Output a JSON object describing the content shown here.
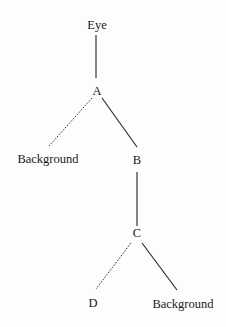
{
  "diagram": {
    "type": "tree",
    "nodes": [
      {
        "id": "eye",
        "label": "Eye",
        "x": 97,
        "y": 28
      },
      {
        "id": "A",
        "label": "A",
        "x": 97,
        "y": 94
      },
      {
        "id": "bg1",
        "label": "Background",
        "x": 48,
        "y": 162
      },
      {
        "id": "B",
        "label": "B",
        "x": 137,
        "y": 163
      },
      {
        "id": "C",
        "label": "C",
        "x": 137,
        "y": 239
      },
      {
        "id": "D",
        "label": "D",
        "x": 93,
        "y": 306
      },
      {
        "id": "bg2",
        "label": "Background",
        "x": 183,
        "y": 307
      }
    ],
    "edges": [
      {
        "from": "eye",
        "to": "A",
        "style": "solid"
      },
      {
        "from": "A",
        "to": "bg1",
        "style": "dashed"
      },
      {
        "from": "A",
        "to": "B",
        "style": "solid"
      },
      {
        "from": "B",
        "to": "C",
        "style": "solid"
      },
      {
        "from": "C",
        "to": "D",
        "style": "dashed"
      },
      {
        "from": "C",
        "to": "bg2",
        "style": "solid"
      }
    ]
  },
  "labels": {
    "eye": "Eye",
    "A": "A",
    "bg1": "Background",
    "B": "B",
    "C": "C",
    "D": "D",
    "bg2": "Background"
  }
}
